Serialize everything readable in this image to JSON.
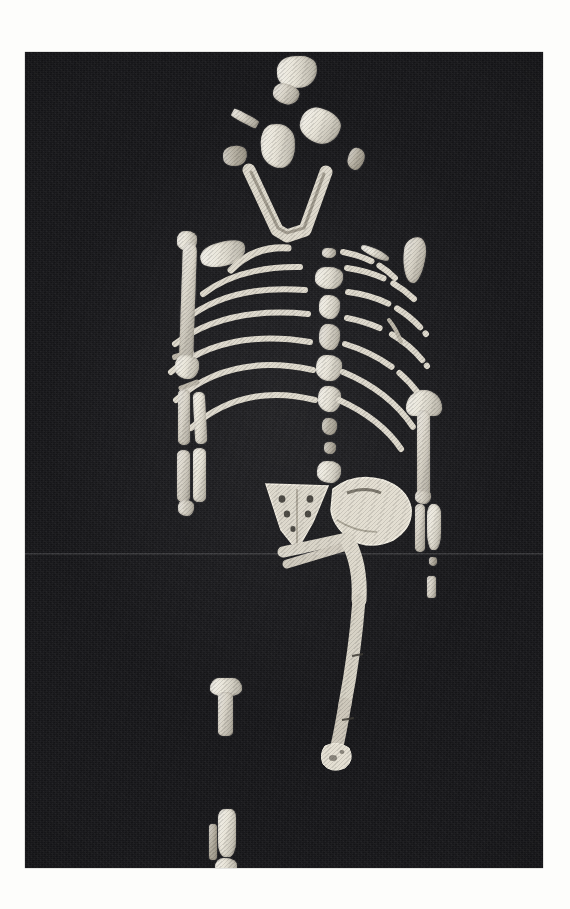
{
  "page": {
    "background_color": "#fdfdfb",
    "margin_note": "white paper margin surrounding a black-and-white photographic plate"
  },
  "photo": {
    "name": "fossil-skeleton-photograph",
    "description": "Monochrome photograph of a partial fossil hominin skeleton laid out in anatomical position on a black background",
    "subject": "partial hominin skeleton (Australopithecus afarensis type specimen layout)",
    "orientation": "anterior view, head at top, feet at bottom",
    "background_color": "#17171a",
    "bone_color": "#d9d4c8",
    "bone_shadow_color": "#b7b1a3",
    "bone_highlight_color": "#e9e5d9",
    "frame": {
      "x": 25,
      "y": 52,
      "width": 518,
      "height": 816
    },
    "artifacts": {
      "scan_seam_y": 553,
      "grain": "visible photographic film grain",
      "vignette": "darkened corners"
    }
  },
  "skeleton": {
    "regions": [
      {
        "name": "cranium",
        "label": "Cranial vault fragments",
        "side": "midline",
        "elements": [
          "frontal fragment",
          "parietal fragments",
          "temporal fragment",
          "occipital fragment"
        ],
        "count": 6
      },
      {
        "name": "mandible",
        "label": "Mandible",
        "side": "midline",
        "elements": [
          "V-shaped mandibular corpus with tooth row"
        ],
        "count": 1
      },
      {
        "name": "vertebral-column",
        "label": "Vertebral column",
        "side": "midline",
        "elements": [
          "cervical vertebra",
          "thoracic vertebrae",
          "lumbar vertebrae"
        ],
        "count": 9
      },
      {
        "name": "left-ribs",
        "label": "Left ribs",
        "side": "left",
        "elements": [
          "rib 1",
          "rib 2",
          "rib 3",
          "rib 4",
          "rib 5",
          "rib 6",
          "rib 7"
        ],
        "count": 7
      },
      {
        "name": "right-ribs",
        "label": "Right ribs",
        "side": "right",
        "elements": [
          "fragmentary rib shafts"
        ],
        "count": 7
      },
      {
        "name": "left-scapula",
        "label": "Left scapula fragment",
        "side": "left",
        "elements": [
          "glenoid / blade fragment"
        ],
        "count": 1
      },
      {
        "name": "right-scapula",
        "label": "Right scapula fragment",
        "side": "right",
        "elements": [
          "blade fragment"
        ],
        "count": 1
      },
      {
        "name": "left-humerus",
        "label": "Left humerus",
        "side": "left",
        "elements": [
          "complete shaft with proximal and distal ends"
        ],
        "count": 1
      },
      {
        "name": "right-humerus",
        "label": "Right humerus",
        "side": "right",
        "elements": [
          "proximal head and shaft"
        ],
        "count": 1
      },
      {
        "name": "left-forearm",
        "label": "Left radius and ulna",
        "side": "left",
        "elements": [
          "ulna shaft",
          "radius shaft",
          "distal fragments"
        ],
        "count": 4
      },
      {
        "name": "right-forearm",
        "label": "Right radius and ulna",
        "side": "right",
        "elements": [
          "ulna shaft",
          "radius shaft",
          "small fragments"
        ],
        "count": 4
      },
      {
        "name": "pelvis",
        "label": "Pelvis",
        "side": "midline",
        "elements": [
          "sacrum",
          "right innominate / ilium blade"
        ],
        "count": 2
      },
      {
        "name": "left-femur",
        "label": "Left femur",
        "side": "left",
        "elements": [
          "complete femur with head, neck, shaft and distal condyles"
        ],
        "count": 1
      },
      {
        "name": "tibia",
        "label": "Tibia",
        "side": "left",
        "elements": [
          "proximal tibia with plateau",
          "distal tibia",
          "fibula fragment"
        ],
        "count": 3
      },
      {
        "name": "foot-fragments",
        "label": "Foot fragments",
        "side": "left",
        "elements": [
          "small tarsal / phalanx fragments"
        ],
        "count": 3
      }
    ]
  }
}
